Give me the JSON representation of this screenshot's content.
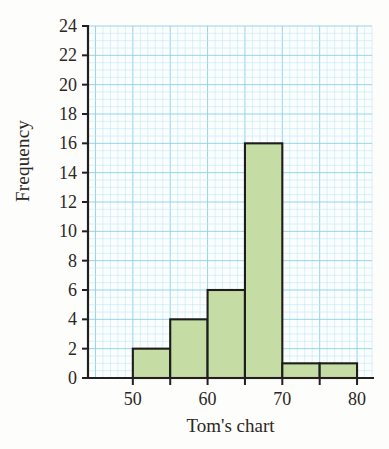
{
  "chart_data": {
    "type": "bar",
    "title": "",
    "subtitle": "",
    "xlabel": "Tom's chart",
    "ylabel": "Frequency",
    "xlim": [
      44,
      82
    ],
    "ylim": [
      0,
      24
    ],
    "grid": true,
    "legend": "none",
    "annotations": [],
    "bin_width": 5,
    "bin_edges": [
      50,
      55,
      60,
      65,
      70,
      75,
      80
    ],
    "categories": [
      "50-55",
      "55-60",
      "60-65",
      "65-70",
      "70-75",
      "75-80"
    ],
    "values": [
      2,
      4,
      6,
      16,
      1,
      1
    ],
    "bars": [
      {
        "start": 50,
        "end": 55,
        "value": 2
      },
      {
        "start": 55,
        "end": 60,
        "value": 4
      },
      {
        "start": 60,
        "end": 65,
        "value": 6
      },
      {
        "start": 65,
        "end": 70,
        "value": 16
      },
      {
        "start": 70,
        "end": 75,
        "value": 1
      },
      {
        "start": 75,
        "end": 80,
        "value": 1
      }
    ],
    "y_ticks": [
      0,
      2,
      4,
      6,
      8,
      10,
      12,
      14,
      16,
      18,
      20,
      22,
      24
    ],
    "y_tick_labels": [
      "0",
      "2",
      "4",
      "6",
      "8",
      "10",
      "12",
      "14",
      "16",
      "18",
      "20",
      "22",
      "24"
    ],
    "x_ticks": [
      50,
      55,
      60,
      65,
      70,
      75,
      80
    ],
    "x_tick_labels_shown": [
      "50",
      "60",
      "70",
      "80"
    ],
    "x_labeled_ticks": [
      50,
      60,
      70,
      80
    ],
    "colors": {
      "bar_fill": "#c5dda5",
      "bar_edge": "#1d1d1b",
      "grid_major": "#8ccfe4",
      "grid_minor": "#bfe6f2",
      "axis": "#231f20",
      "background": "#fdfdfb",
      "plot_background": "#fbfeff",
      "text": "#2b2724"
    }
  }
}
